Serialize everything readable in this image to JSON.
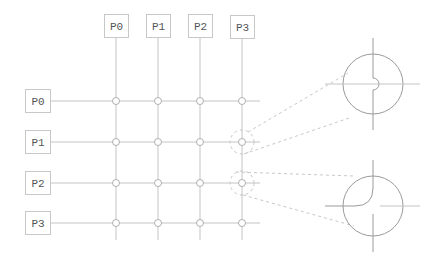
{
  "diagram": {
    "column_labels": [
      "P0",
      "P1",
      "P2",
      "P3"
    ],
    "row_labels": [
      "P0",
      "P1",
      "P2",
      "P3"
    ],
    "callouts": [
      {
        "name": "crossing-hop-detail",
        "source_row": "P1",
        "source_col": "P3"
      },
      {
        "name": "rounded-corner-detail",
        "source_row": "P2",
        "source_col": "P3"
      }
    ],
    "colors": {
      "line": "#c4c4c4",
      "detail_line": "#9a9a9a",
      "text": "#555555",
      "box_border": "#c8c8c8"
    }
  }
}
